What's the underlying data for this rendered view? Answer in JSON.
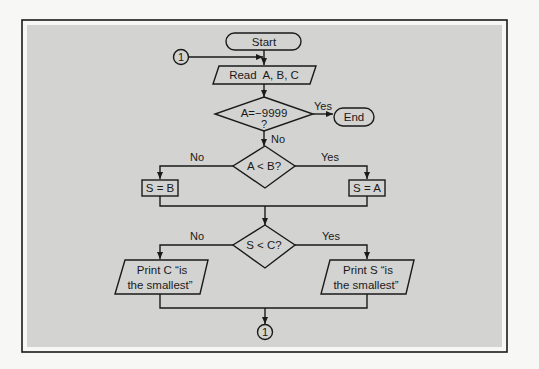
{
  "diagram": {
    "type": "flowchart",
    "nodes": {
      "start": {
        "kind": "terminal",
        "label": "Start"
      },
      "connector_in": {
        "kind": "connector",
        "label": "1"
      },
      "read": {
        "kind": "input-output",
        "label": "Read  A, B, C"
      },
      "check_end": {
        "kind": "decision",
        "label_line1": "A=−9999",
        "label_line2": "?"
      },
      "end": {
        "kind": "terminal",
        "label": "End"
      },
      "compare_ab": {
        "kind": "decision",
        "label": "A < B?"
      },
      "assign_b": {
        "kind": "process",
        "label": "S = B"
      },
      "assign_a": {
        "kind": "process",
        "label": "S = A"
      },
      "compare_sc": {
        "kind": "decision",
        "label": "S < C?"
      },
      "print_c": {
        "kind": "input-output",
        "label_line1": "Print C “is",
        "label_line2": "the smallest”"
      },
      "print_s": {
        "kind": "input-output",
        "label_line1": "Print S “is",
        "label_line2": "the smallest”"
      },
      "connector_out": {
        "kind": "connector",
        "label": "1"
      }
    },
    "edges": {
      "check_end_yes": "Yes",
      "check_end_no": "No",
      "compare_ab_no": "No",
      "compare_ab_yes": "Yes",
      "compare_sc_no": "No",
      "compare_sc_yes": "Yes"
    },
    "colors": {
      "background": "#d3d3d1",
      "ink": "#1a1a1a",
      "page": "#f7f7f5"
    }
  }
}
